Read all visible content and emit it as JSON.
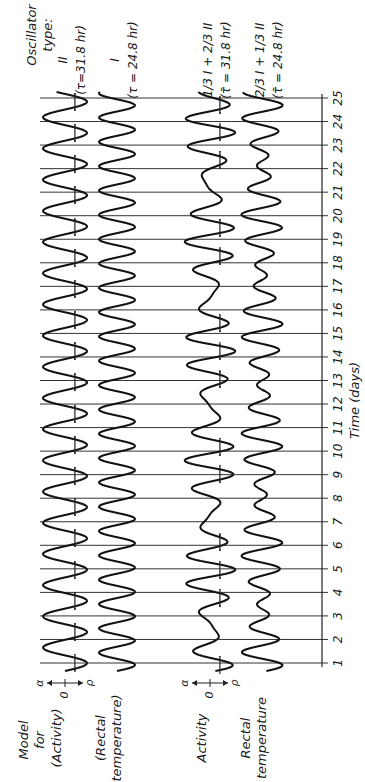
{
  "figure": {
    "orientation": "rotated-90-ccw",
    "header_label": [
      "Oscillator",
      "type:"
    ],
    "row_group_label": [
      "Model",
      "for"
    ],
    "axis_title": "Time (days)"
  },
  "traces": [
    {
      "id": "model-activity",
      "row_label": "(Activity)",
      "oscillator_label": "II",
      "period_label": "(τ=31.8 hr)",
      "period_hr": 31.8,
      "column_x": 65,
      "amplitude_px": 22,
      "has_dotted_peaks": true,
      "scale_marks": {
        "alpha": "α",
        "zero": "0",
        "rho": "ρ"
      }
    },
    {
      "id": "model-rectal-temperature",
      "row_label": [
        "(Rectal",
        "temperature)"
      ],
      "oscillator_label": "I",
      "period_label": "(τ = 24.8 hr)",
      "period_hr": 24.8,
      "column_x": 117,
      "amplitude_px": 18,
      "has_dotted_peaks": false
    },
    {
      "id": "activity",
      "row_label": "Activity",
      "oscillator_label": "1/3 I + 2/3 II",
      "period_label": "(τ̄ = 31.8 hr)",
      "period_hr": 31.8,
      "column_x": 210,
      "amplitude_px": 22,
      "has_dotted_peaks": true,
      "scale_marks": {
        "alpha": "α",
        "zero": "0",
        "rho": "ρ"
      }
    },
    {
      "id": "rectal-temperature",
      "row_label": [
        "Rectal",
        "temperature"
      ],
      "oscillator_label": "2/3 I + 1/3 II",
      "period_label": "(τ̄ = 24.8 hr)",
      "period_hr": 24.8,
      "column_x": 262,
      "amplitude_px": 18,
      "has_dotted_peaks": false
    }
  ],
  "chart_data": {
    "type": "line",
    "xlabel": "Time (days)",
    "ylabel": "",
    "x_ticks": [
      1,
      2,
      3,
      4,
      5,
      6,
      7,
      8,
      9,
      10,
      11,
      12,
      13,
      14,
      15,
      16,
      17,
      18,
      19,
      20,
      21,
      22,
      23,
      24,
      25
    ],
    "xlim": [
      1,
      25
    ],
    "grid": true,
    "series": [
      {
        "name": "Model Activity — Oscillator II (τ=31.8 hr)",
        "period_hr": 31.8
      },
      {
        "name": "Model Rectal temperature — Oscillator I (τ=24.8 hr)",
        "period_hr": 24.8
      },
      {
        "name": "Activity — 1/3 I + 2/3 II (τ̄=31.8 hr)",
        "period_hr": 31.8
      },
      {
        "name": "Rectal temperature — 2/3 I + 1/3 II (τ̄=24.8 hr)",
        "period_hr": 24.8
      }
    ],
    "annotations": [
      "α",
      "0",
      "ρ",
      "Oscillator type:",
      "Model for"
    ]
  },
  "layout": {
    "day1_y": 663,
    "day25_y": 98,
    "grid_x_start": 40,
    "grid_x_end": 322,
    "axis_x": 322,
    "tick_label_x": 338
  }
}
